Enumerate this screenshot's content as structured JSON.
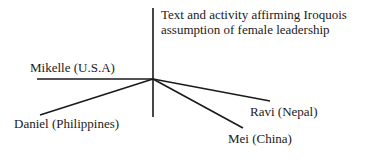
{
  "diagram": {
    "center_label": "Text and activity affirming Iroquois assumption of female leadership",
    "center_label_lines": [
      "Text and activity affirming Iroquois",
      "assumption of female leadership"
    ],
    "nodes": [
      {
        "id": "mikelle",
        "label": "Mikelle (U.S.A)"
      },
      {
        "id": "daniel",
        "label": "Daniel (Philippines)"
      },
      {
        "id": "ravi",
        "label": "Ravi (Nepal)"
      },
      {
        "id": "mei",
        "label": "Mei (China)"
      }
    ],
    "line_color": "#1a1a1a"
  }
}
